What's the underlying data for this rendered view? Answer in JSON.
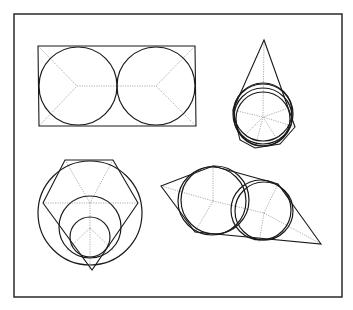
{
  "figure": {
    "frame": {
      "x": 14,
      "y": 14,
      "width": 328,
      "height": 283
    },
    "colors": {
      "line": "#1a1a1a",
      "construction": "#8a8a8a",
      "frame": "#2a2a2a",
      "background": "#ffffff"
    },
    "panels": [
      {
        "id": "rectangle-two-circles",
        "description": "Rectangle with two equal inscribed tangent circles and medial-axis construction lines",
        "polygon": [
          [
            38,
            46
          ],
          [
            195,
            46
          ],
          [
            196,
            126
          ],
          [
            39,
            126
          ]
        ],
        "circles": [
          {
            "cx": 78,
            "cy": 86,
            "r": 39
          },
          {
            "cx": 156,
            "cy": 86,
            "r": 39
          }
        ],
        "construction_lines": [
          [
            [
              38,
              46
            ],
            [
              77,
              86
            ]
          ],
          [
            [
              39,
              126
            ],
            [
              77,
              86
            ]
          ],
          [
            [
              77,
              86
            ],
            [
              156,
              86
            ]
          ],
          [
            [
              195,
              46
            ],
            [
              156,
              86
            ]
          ],
          [
            [
              196,
              126
            ],
            [
              156,
              86
            ]
          ]
        ]
      },
      {
        "id": "kite-nested-circles",
        "description": "Kite-shaped polygon with apex up and several nearly-coincident inscribed circles",
        "polygon": [
          [
            264,
            40
          ],
          [
            295,
            127
          ],
          [
            280,
            144
          ],
          [
            255,
            148
          ],
          [
            240,
            140
          ],
          [
            233,
            110
          ]
        ],
        "circles": [
          {
            "cx": 263,
            "cy": 112,
            "r": 29
          },
          {
            "cx": 263,
            "cy": 114,
            "r": 30
          },
          {
            "cx": 263,
            "cy": 117,
            "r": 29
          },
          {
            "cx": 263,
            "cy": 119,
            "r": 27
          }
        ],
        "construction_lines": [
          [
            [
              264,
              40
            ],
            [
              263,
              117
            ]
          ],
          [
            [
              233,
              110
            ],
            [
              263,
              117
            ]
          ],
          [
            [
              295,
              127
            ],
            [
              263,
              117
            ]
          ],
          [
            [
              286,
              109
            ],
            [
              263,
              117
            ]
          ],
          [
            [
              280,
              144
            ],
            [
              263,
              117
            ]
          ],
          [
            [
              255,
              148
            ],
            [
              263,
              117
            ]
          ],
          [
            [
              240,
              140
            ],
            [
              263,
              117
            ]
          ]
        ]
      },
      {
        "id": "pentagon-two-circles",
        "description": "Irregular pentagon (flat top, pointed bottom) with large and small inscribed circles",
        "polygon": [
          [
            65,
            160
          ],
          [
            113,
            160
          ],
          [
            138,
            203
          ],
          [
            92,
            270
          ],
          [
            43,
            203
          ]
        ],
        "circles": [
          {
            "cx": 90,
            "cy": 213,
            "r": 52
          },
          {
            "cx": 90,
            "cy": 227,
            "r": 31
          },
          {
            "cx": 90,
            "cy": 237,
            "r": 20
          }
        ],
        "construction_lines": [
          [
            [
              43,
              203
            ],
            [
              138,
              203
            ]
          ],
          [
            [
              90,
              203
            ],
            [
              90,
              270
            ]
          ],
          [
            [
              65,
              160
            ],
            [
              90,
              203
            ]
          ],
          [
            [
              113,
              160
            ],
            [
              90,
              203
            ]
          ],
          [
            [
              90,
              228
            ],
            [
              66,
              251
            ]
          ],
          [
            [
              90,
              228
            ],
            [
              114,
              251
            ]
          ]
        ]
      },
      {
        "id": "skewed-quadrilateral-two-circles",
        "description": "Elongated skewed polygon with two overlapping inscribed circle pairs",
        "polygon": [
          [
            161,
            186
          ],
          [
            213,
            166
          ],
          [
            278,
            184
          ],
          [
            321,
            244
          ],
          [
            195,
            232
          ]
        ],
        "circles": [
          {
            "cx": 212,
            "cy": 201,
            "r": 34
          },
          {
            "cx": 215,
            "cy": 200,
            "r": 34
          },
          {
            "cx": 261,
            "cy": 210,
            "r": 30
          },
          {
            "cx": 264,
            "cy": 211,
            "r": 29
          }
        ],
        "construction_lines": [
          [
            [
              161,
              186
            ],
            [
              213,
              201
            ]
          ],
          [
            [
              213,
              166
            ],
            [
              213,
              201
            ]
          ],
          [
            [
              195,
              232
            ],
            [
              213,
              201
            ]
          ],
          [
            [
              213,
              201
            ],
            [
              264,
              213
            ]
          ],
          [
            [
              264,
              213
            ],
            [
              278,
              184
            ]
          ],
          [
            [
              264,
              213
            ],
            [
              259,
              242
            ]
          ],
          [
            [
              264,
              213
            ],
            [
              321,
              244
            ]
          ]
        ]
      }
    ]
  }
}
